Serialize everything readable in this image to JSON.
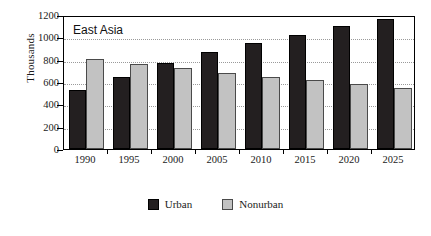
{
  "chart_data": {
    "type": "bar",
    "title": "East Asia",
    "xlabel": "",
    "ylabel": "Thousands",
    "categories": [
      "1990",
      "1995",
      "2000",
      "2005",
      "2010",
      "2015",
      "2020",
      "2025"
    ],
    "series": [
      {
        "name": "Urban",
        "color": "#231f20",
        "values": [
          525,
          645,
          770,
          870,
          945,
          1025,
          1100,
          1165
        ]
      },
      {
        "name": "Nonurban",
        "color": "#c2c2c2",
        "values": [
          805,
          765,
          725,
          680,
          645,
          615,
          580,
          545
        ]
      }
    ],
    "ylim": [
      0,
      1200
    ],
    "yticks": [
      0,
      200,
      400,
      600,
      800,
      1000,
      1200
    ],
    "ytick_labels": [
      "0",
      "200",
      "400",
      "600",
      "800",
      "1000",
      "1200"
    ],
    "grid": true,
    "grid_axis": "y",
    "legend_position": "bottom-center"
  },
  "legend": {
    "items": [
      {
        "label": "Urban",
        "swatch": "urban-swatch"
      },
      {
        "label": "Nonurban",
        "swatch": "nonurban-swatch"
      }
    ]
  }
}
